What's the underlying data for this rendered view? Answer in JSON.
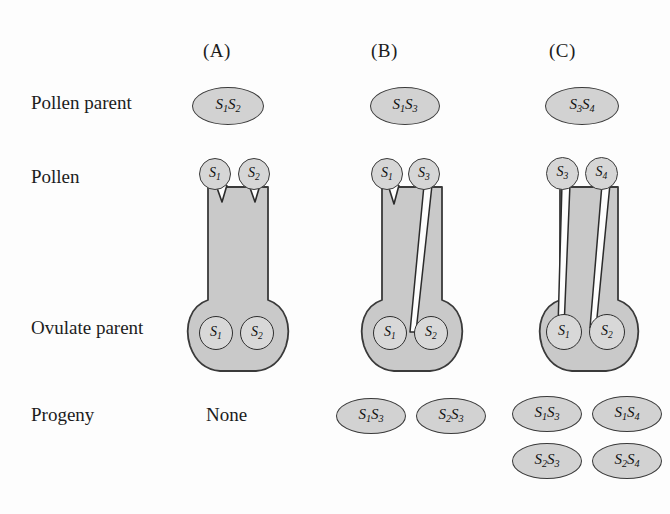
{
  "figure": {
    "background": "#fdfdfd",
    "pistil_fill": "#c9c9c9",
    "pistil_stroke": "#3a3a3a",
    "ellipse_fill": "#d2d2d2",
    "tube_stroke": "#1c1c1c"
  },
  "row_labels": [
    {
      "id": "pollen-parent",
      "text": "Pollen parent"
    },
    {
      "id": "pollen",
      "text": "Pollen"
    },
    {
      "id": "ovulate-parent",
      "text": "Ovulate parent"
    },
    {
      "id": "progeny",
      "text": "Progeny"
    }
  ],
  "panels": [
    {
      "id": "A",
      "label": "(A)",
      "pollen_parent": {
        "alleles": "S1S2",
        "display": [
          "S",
          "1",
          "S",
          "2"
        ]
      },
      "pollen_grains": [
        {
          "allele": "S1",
          "letter": "S",
          "sub": "1",
          "tube": "rejected"
        },
        {
          "allele": "S2",
          "letter": "S",
          "sub": "2",
          "tube": "rejected"
        }
      ],
      "ovulate_parent": {
        "ovules": [
          {
            "allele": "S1",
            "letter": "S",
            "sub": "1"
          },
          {
            "allele": "S2",
            "letter": "S",
            "sub": "2"
          }
        ]
      },
      "progeny": [],
      "progeny_none_label": "None"
    },
    {
      "id": "B",
      "label": "(B)",
      "pollen_parent": {
        "alleles": "S1S3",
        "display": [
          "S",
          "1",
          "S",
          "3"
        ]
      },
      "pollen_grains": [
        {
          "allele": "S1",
          "letter": "S",
          "sub": "1",
          "tube": "rejected"
        },
        {
          "allele": "S3",
          "letter": "S",
          "sub": "3",
          "tube": "full"
        }
      ],
      "ovulate_parent": {
        "ovules": [
          {
            "allele": "S1",
            "letter": "S",
            "sub": "1"
          },
          {
            "allele": "S2",
            "letter": "S",
            "sub": "2"
          }
        ]
      },
      "progeny": [
        {
          "alleles": "S1S3",
          "letter1": "S",
          "sub1": "1",
          "letter2": "S",
          "sub2": "3"
        },
        {
          "alleles": "S2S3",
          "letter1": "S",
          "sub1": "2",
          "letter2": "S",
          "sub2": "3"
        }
      ],
      "progeny_none_label": ""
    },
    {
      "id": "C",
      "label": "(C)",
      "pollen_parent": {
        "alleles": "S3S4",
        "display": [
          "S",
          "3",
          "S",
          "4"
        ]
      },
      "pollen_grains": [
        {
          "allele": "S3",
          "letter": "S",
          "sub": "3",
          "tube": "full"
        },
        {
          "allele": "S4",
          "letter": "S",
          "sub": "4",
          "tube": "full"
        }
      ],
      "ovulate_parent": {
        "ovules": [
          {
            "allele": "S1",
            "letter": "S",
            "sub": "1"
          },
          {
            "allele": "S2",
            "letter": "S",
            "sub": "2"
          }
        ]
      },
      "progeny": [
        {
          "alleles": "S1S3",
          "letter1": "S",
          "sub1": "1",
          "letter2": "S",
          "sub2": "3"
        },
        {
          "alleles": "S1S4",
          "letter1": "S",
          "sub1": "1",
          "letter2": "S",
          "sub2": "4"
        },
        {
          "alleles": "S2S3",
          "letter1": "S",
          "sub1": "2",
          "letter2": "S",
          "sub2": "3"
        },
        {
          "alleles": "S2S4",
          "letter1": "S",
          "sub1": "2",
          "letter2": "S",
          "sub2": "4"
        }
      ],
      "progeny_none_label": ""
    }
  ]
}
